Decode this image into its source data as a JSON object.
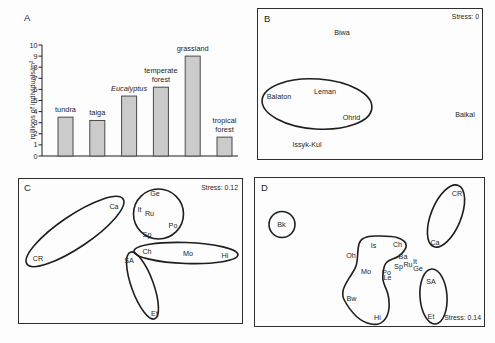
{
  "figure": {
    "background": "#fdfdfd",
    "ink": "#1e1e1e",
    "box_border": "#2d2d2d"
  },
  "chart_data": [
    {
      "type": "bar",
      "panel": "A",
      "ylabel": "millions of individuals/m²",
      "ylim": [
        0,
        10
      ],
      "ytick_step": 1,
      "categories": [
        "tundra",
        "taiga",
        "Eucalyptus",
        "temperate\nforest",
        "grassland",
        "tropical\nforest"
      ],
      "italic_flags": [
        false,
        false,
        true,
        false,
        false,
        false
      ],
      "values": [
        3.5,
        3.2,
        5.4,
        6.2,
        9.0,
        1.7
      ],
      "bar_fill": "#cbcbcb",
      "bar_stroke": "#4a4a4a",
      "grid": false
    },
    {
      "type": "scatter",
      "panel": "B",
      "stress": "Stress: 0",
      "stress_corner": "top-right",
      "points": [
        {
          "label": "Biwa",
          "x": 84,
          "y": 23.5
        },
        {
          "label": "Balaton",
          "x": 21,
          "y": 87
        },
        {
          "label": "Leman",
          "x": 67,
          "y": 82.5
        },
        {
          "label": "Ohrid",
          "x": 93.5,
          "y": 108.5
        },
        {
          "label": "Baikal",
          "x": 207,
          "y": 105
        },
        {
          "label": "Issyk-Kul",
          "x": 49,
          "y": 135
        }
      ],
      "ellipses": [
        {
          "cx": 59,
          "cy": 95,
          "rx": 55,
          "ry": 25,
          "rot": 4
        }
      ]
    },
    {
      "type": "scatter",
      "panel": "C",
      "stress": "Stress: 0.12",
      "stress_corner": "top-right",
      "points": [
        {
          "label": "CR",
          "x": 19,
          "y": 79
        },
        {
          "label": "Ca",
          "x": 95,
          "y": 27
        },
        {
          "label": "Ge",
          "x": 136,
          "y": 14
        },
        {
          "label": "It",
          "x": 120.5,
          "y": 30.5
        },
        {
          "label": "Ru",
          "x": 130.5,
          "y": 34
        },
        {
          "label": "Po",
          "x": 154,
          "y": 46
        },
        {
          "label": "Sp",
          "x": 128,
          "y": 55
        },
        {
          "label": "Ch",
          "x": 128,
          "y": 72.5
        },
        {
          "label": "Mo",
          "x": 169,
          "y": 74
        },
        {
          "label": "Hi",
          "x": 206,
          "y": 76.5
        },
        {
          "label": "SA",
          "x": 110,
          "y": 81.5
        },
        {
          "label": "Et",
          "x": 135.5,
          "y": 134
        }
      ],
      "ellipses": [
        {
          "cx": 56,
          "cy": 52.5,
          "rx": 58,
          "ry": 16,
          "rot": -34
        },
        {
          "cx": 139.5,
          "cy": 35,
          "rx": 25,
          "ry": 25,
          "rot": 0
        },
        {
          "cx": 167,
          "cy": 74,
          "rx": 52,
          "ry": 10.5,
          "rot": 2
        },
        {
          "cx": 123.5,
          "cy": 106.5,
          "rx": 11,
          "ry": 35.5,
          "rot": -20
        }
      ]
    },
    {
      "type": "scatter",
      "panel": "D",
      "stress": "Stress: 0.14",
      "stress_corner": "bottom-right",
      "points": [
        {
          "label": "Bk",
          "x": 26.5,
          "y": 46.5
        },
        {
          "label": "CR",
          "x": 202,
          "y": 15
        },
        {
          "label": "Ca",
          "x": 180,
          "y": 64
        },
        {
          "label": "Oh",
          "x": 96,
          "y": 77
        },
        {
          "label": "Is",
          "x": 118.5,
          "y": 67.5
        },
        {
          "label": "Ch",
          "x": 142.5,
          "y": 66
        },
        {
          "label": "Mo",
          "x": 111,
          "y": 93
        },
        {
          "label": "Ba",
          "x": 148,
          "y": 78
        },
        {
          "label": "Ru",
          "x": 153,
          "y": 86
        },
        {
          "label": "It",
          "x": 160,
          "y": 83
        },
        {
          "label": "Sp",
          "x": 143.5,
          "y": 88.5
        },
        {
          "label": "Ge",
          "x": 163,
          "y": 90
        },
        {
          "label": "Po",
          "x": 131.5,
          "y": 94.5
        },
        {
          "label": "Le",
          "x": 132.5,
          "y": 99.5
        },
        {
          "label": "Bw",
          "x": 96.5,
          "y": 120.5
        },
        {
          "label": "Hi",
          "x": 122.5,
          "y": 139.5
        },
        {
          "label": "SA",
          "x": 176,
          "y": 103
        },
        {
          "label": "Et",
          "x": 176,
          "y": 138
        }
      ],
      "ellipses": [
        {
          "cx": 27,
          "cy": 46.5,
          "rx": 13,
          "ry": 13,
          "rot": 0
        },
        {
          "cx": 191,
          "cy": 38,
          "rx": 15,
          "ry": 33,
          "rot": 22
        },
        {
          "cx": 178.5,
          "cy": 118.5,
          "rx": 13.5,
          "ry": 27.5,
          "rot": -4
        }
      ],
      "outline_path": "M 104 66 C 105.5 60.5 112 58 120 58 C 128 58 136 57.5 142 59.5 C 148 61.5 152 65 151 69 C 150 73 147 75.5 144 78 C 140 81 135 81 131.5 84.5 C 128 88 128.2 93 127.8 99.5 C 127.6 105 131 109.5 132.6 115 C 134.3 120.5 134.4 125 134 130 C 133.6 134.5 132 139.5 128.5 143 C 125.5 146 120 146.8 116 146 C 111.5 145.2 106 142.5 101.5 138.5 C 96.5 133.5 91.5 126.5 89 121.5 C 87.5 118.5 87.5 116 88 113 C 88.8 108.5 92 103.5 94.5 99.5 C 97 95.5 99.7 92.3 101 88 C 102.3 83.8 102.5 80 102.7 76 C 102.9 72.3 103.2 68.8 104 66 Z"
    }
  ]
}
